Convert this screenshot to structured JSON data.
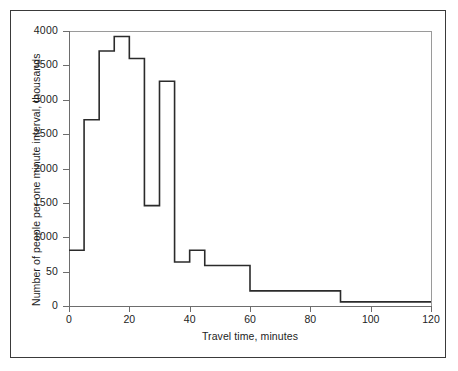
{
  "chart_data": {
    "type": "area",
    "title": "",
    "subtitle": "",
    "xlabel": "Travel time, minutes",
    "ylabel": "Number of people per one minute interval, thousands",
    "xlim": [
      0,
      120
    ],
    "ylim": [
      0,
      4000
    ],
    "grid": false,
    "legend": null,
    "annotations": [],
    "x_ticks": [
      0,
      20,
      40,
      60,
      80,
      100,
      120
    ],
    "x_tick_labels": [
      "0",
      "20",
      "40",
      "60",
      "80",
      "100",
      "120"
    ],
    "y_ticks": [
      0,
      500,
      1000,
      1500,
      2000,
      2500,
      3000,
      3500,
      4000
    ],
    "y_tick_labels": [
      "0",
      "50",
      "1000",
      "1500",
      "2000",
      "2500",
      "3000",
      "3500",
      "4000"
    ],
    "step_style": "post",
    "bin_edges": [
      0,
      5,
      10,
      15,
      20,
      25,
      27,
      30,
      35,
      40,
      45,
      60,
      90,
      120
    ],
    "values": [
      810,
      2710,
      3710,
      3920,
      3600,
      3600,
      1460,
      3270,
      640,
      810,
      590,
      220,
      60
    ],
    "bins": [
      {
        "start": 0,
        "end": 5,
        "value": 810
      },
      {
        "start": 5,
        "end": 10,
        "value": 2710
      },
      {
        "start": 10,
        "end": 15,
        "value": 3710
      },
      {
        "start": 15,
        "end": 20,
        "value": 3920
      },
      {
        "start": 20,
        "end": 25,
        "value": 3600
      },
      {
        "start": 25,
        "end": 30,
        "value": 1460
      },
      {
        "start": 30,
        "end": 35,
        "value": 3270
      },
      {
        "start": 35,
        "end": 40,
        "value": 640
      },
      {
        "start": 40,
        "end": 45,
        "value": 810
      },
      {
        "start": 45,
        "end": 60,
        "value": 590
      },
      {
        "start": 60,
        "end": 90,
        "value": 220
      },
      {
        "start": 90,
        "end": 120,
        "value": 60
      }
    ],
    "line_color": "#2b2b2b",
    "axis_color": "#6d6d6d",
    "frame_color": "#3a3a3a",
    "background": "#ffffff"
  },
  "caption": ""
}
